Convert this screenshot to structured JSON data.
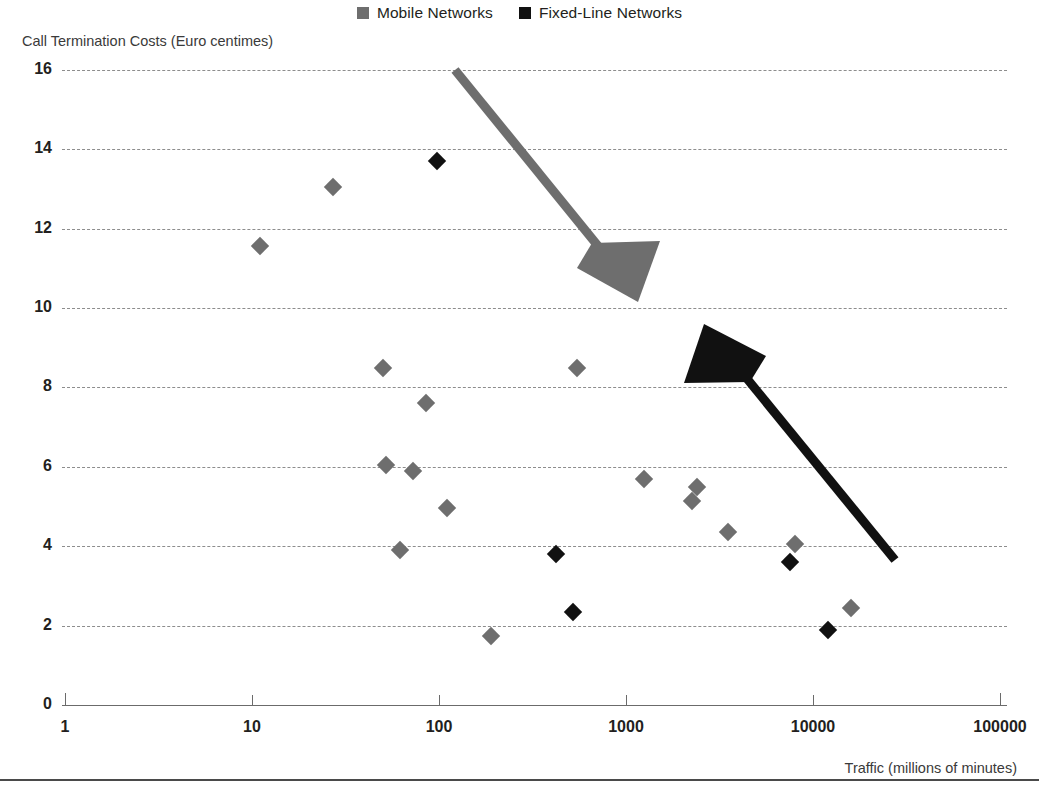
{
  "legend": {
    "position": "top-center",
    "entries": [
      {
        "label": "Mobile Networks",
        "color": "#6e6e6e",
        "marker": "square"
      },
      {
        "label": "Fixed-Line Networks",
        "color": "#111111",
        "marker": "square"
      }
    ]
  },
  "axes": {
    "y_title": "Call Termination Costs (Euro centimes)",
    "x_title": "Traffic (millions of minutes)",
    "y_ticks": [
      "16",
      "14",
      "12",
      "10",
      "8",
      "6",
      "4",
      "2",
      "0"
    ],
    "x_ticks": [
      "1",
      "10",
      "100",
      "1000",
      "10000",
      "100000"
    ]
  },
  "annotations": [
    {
      "name": "mobile-trend-arrow",
      "color": "#6e6e6e",
      "direction": "down-right"
    },
    {
      "name": "fixedline-trend-arrow",
      "color": "#111111",
      "direction": "up-left"
    }
  ],
  "chart_data": {
    "type": "scatter",
    "title": "",
    "xlabel": "Traffic (millions of minutes)",
    "ylabel": "Call Termination Costs (Euro centimes)",
    "xscale": "log",
    "yscale": "linear",
    "xlim": [
      1,
      100000
    ],
    "ylim": [
      0,
      16
    ],
    "xticks": [
      1,
      10,
      100,
      1000,
      10000,
      100000
    ],
    "yticks": [
      0,
      2,
      4,
      6,
      8,
      10,
      12,
      14,
      16
    ],
    "grid": "horizontal-dashed",
    "legend_position": "top-center",
    "series": [
      {
        "name": "Mobile Networks",
        "color": "#6e6e6e",
        "marker": "diamond",
        "points": [
          {
            "x": 11,
            "y": 11.55
          },
          {
            "x": 27,
            "y": 13.05
          },
          {
            "x": 50,
            "y": 8.5
          },
          {
            "x": 52,
            "y": 6.05
          },
          {
            "x": 62,
            "y": 3.9
          },
          {
            "x": 73,
            "y": 5.9
          },
          {
            "x": 85,
            "y": 7.6
          },
          {
            "x": 110,
            "y": 4.95
          },
          {
            "x": 190,
            "y": 1.75
          },
          {
            "x": 550,
            "y": 8.5
          },
          {
            "x": 1250,
            "y": 5.7
          },
          {
            "x": 2250,
            "y": 5.15
          },
          {
            "x": 2400,
            "y": 5.5
          },
          {
            "x": 3500,
            "y": 4.35
          },
          {
            "x": 8000,
            "y": 4.05
          },
          {
            "x": 16000,
            "y": 2.45
          }
        ]
      },
      {
        "name": "Fixed-Line Networks",
        "color": "#111111",
        "marker": "diamond",
        "points": [
          {
            "x": 98,
            "y": 13.7
          },
          {
            "x": 420,
            "y": 3.8
          },
          {
            "x": 520,
            "y": 2.35
          },
          {
            "x": 7500,
            "y": 3.6
          },
          {
            "x": 12000,
            "y": 1.9
          }
        ]
      }
    ]
  }
}
